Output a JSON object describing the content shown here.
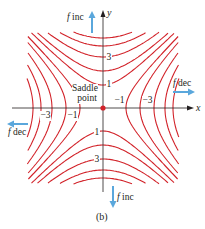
{
  "figure": {
    "caption": "(b)",
    "colors": {
      "contour": "#d2232a",
      "axis": "#231f20",
      "arrow": "#5aa7dc",
      "point": "#d2232a",
      "text": "#231f20"
    },
    "axes": {
      "x_label": "x",
      "y_label": "y"
    },
    "saddle_point": {
      "label_line1": "Saddle",
      "label_line2": "point"
    },
    "direction_notes": {
      "top": {
        "f": "f",
        "text": " inc"
      },
      "bottom": {
        "f": "f",
        "text": " inc"
      },
      "right": {
        "f": "f",
        "text": " dec"
      },
      "left": {
        "f": "f",
        "text": " dec"
      }
    },
    "contour_labels": {
      "top_1": "1",
      "top_3": "3",
      "bottom_1": "1",
      "bottom_3": "3",
      "right_m1": "−1",
      "right_m3": "−3",
      "left_m1": "−1",
      "left_m3": "−3"
    }
  },
  "chart_data": {
    "type": "contour",
    "title": "",
    "caption": "(b)",
    "xlabel": "x",
    "ylabel": "y",
    "saddle_point": [
      0,
      0
    ],
    "levels_positive": [
      1,
      2,
      3,
      4,
      5,
      6
    ],
    "levels_negative": [
      -1,
      -2,
      -3,
      -4,
      -5,
      -6
    ],
    "labeled_levels": {
      "y_axis_positive": [
        1,
        3
      ],
      "y_axis_negative": [
        1,
        3
      ],
      "x_axis_positive": [
        -1,
        -3
      ],
      "x_axis_negative": [
        -1,
        -3
      ]
    },
    "annotations": [
      "f inc (up, +y)",
      "f inc (down, -y)",
      "f dec (right, +x)",
      "f dec (left, -x)",
      "Saddle point"
    ]
  }
}
